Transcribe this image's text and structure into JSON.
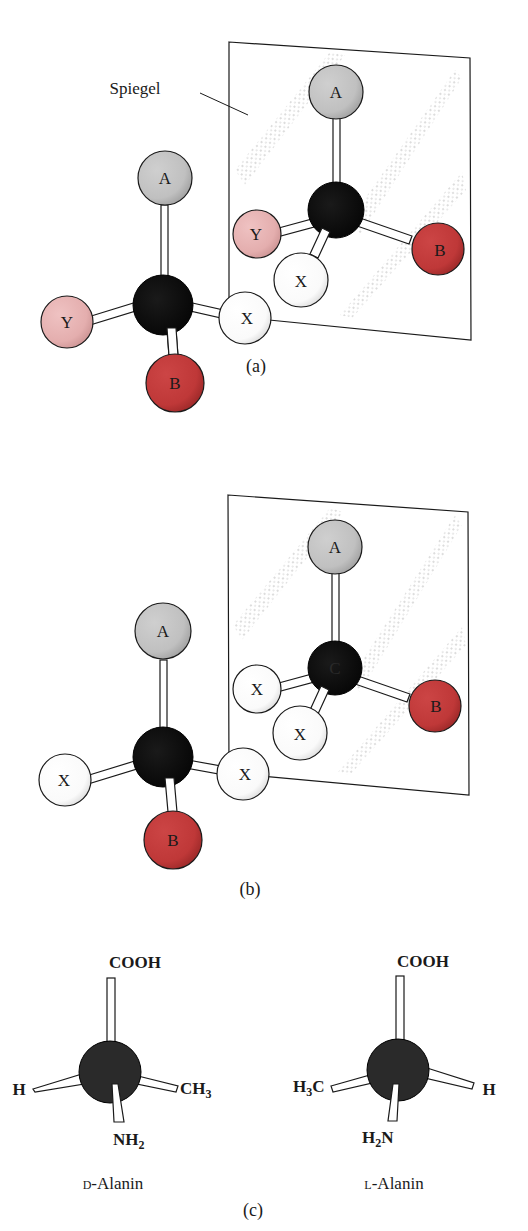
{
  "figure": {
    "colors": {
      "carbon": "#111111",
      "A": "#c4c4c4",
      "B": "#c23a3a",
      "X": "#ffffff",
      "Y": "#e8b4b4",
      "bond": "#ffffff",
      "outline": "#1a1a1a",
      "stipple": "#9a9a9a"
    },
    "panel_a": {
      "label": "(a)",
      "mirror_label": "Spiegel",
      "left_molecule": {
        "top": "A",
        "left": "Y",
        "right": "X",
        "bottom": "B"
      },
      "mirror_image": {
        "top": "A",
        "left": "Y",
        "front": "X",
        "right": "B"
      }
    },
    "panel_b": {
      "label": "(b)",
      "center_label": "C",
      "left_molecule": {
        "top": "A",
        "left": "X",
        "right": "X",
        "bottom": "B"
      },
      "mirror_image": {
        "top": "A",
        "left": "X",
        "front": "X",
        "right": "B"
      }
    },
    "panel_c": {
      "label": "(c)",
      "d_alanine": {
        "top": "COOH",
        "left": "H",
        "right_main": "CH",
        "right_sub": "3",
        "bottom_main": "NH",
        "bottom_sub": "2",
        "name_prefix": "D",
        "name_rest": "-Alanin"
      },
      "l_alanine": {
        "top": "COOH",
        "left_main1": "H",
        "left_sub": "3",
        "left_main2": "C",
        "right": "H",
        "bottom_main1": "H",
        "bottom_sub": "2",
        "bottom_main2": "N",
        "name_prefix": "L",
        "name_rest": "-Alanin"
      }
    }
  }
}
